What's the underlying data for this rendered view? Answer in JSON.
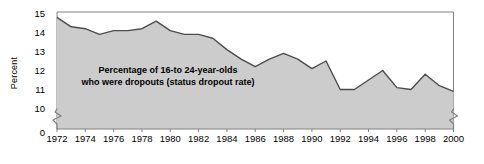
{
  "figure": {
    "ylabel": "Percent",
    "annotation_line1": "Percentage of 16-to 24-year-olds",
    "annotation_line2": "who were dropouts (status dropout rate)",
    "axis_break_label": "0",
    "fill_color": "#cccccc",
    "line_color": "#4d4d4d",
    "frame_color": "#808080",
    "text_color": "#000000"
  },
  "chart_data": {
    "type": "area",
    "title": "",
    "subtitle": "",
    "xlabel": "",
    "ylabel": "Percent",
    "xlim": [
      1972,
      2000
    ],
    "ylim": [
      9.5,
      15
    ],
    "y_axis_break": true,
    "y_break_between": [
      0,
      9.5
    ],
    "grid": false,
    "legend": "none",
    "annotations": [
      "Percentage of 16-to 24-year-olds",
      "who were dropouts (status dropout rate)"
    ],
    "ytick_labels": [
      "0",
      "10",
      "11",
      "12",
      "13",
      "14",
      "15"
    ],
    "yticks": [
      0,
      10,
      11,
      12,
      13,
      14,
      15
    ],
    "xtick_labels": [
      "1972",
      "1974",
      "1976",
      "1978",
      "1980",
      "1982",
      "1984",
      "1986",
      "1988",
      "1990",
      "1992",
      "1994",
      "1996",
      "1998",
      "2000"
    ],
    "xticks": [
      1972,
      1974,
      1976,
      1978,
      1980,
      1982,
      1984,
      1986,
      1988,
      1990,
      1992,
      1994,
      1996,
      1998,
      2000
    ],
    "series": [
      {
        "name": "Status dropout rate",
        "x": [
          1972,
          1973,
          1974,
          1975,
          1976,
          1977,
          1978,
          1979,
          1980,
          1981,
          1982,
          1983,
          1984,
          1985,
          1986,
          1987,
          1988,
          1989,
          1990,
          1991,
          1992,
          1993,
          1994,
          1995,
          1996,
          1997,
          1998,
          1999,
          2000
        ],
        "values": [
          14.8,
          14.3,
          14.2,
          13.9,
          14.1,
          14.1,
          14.2,
          14.6,
          14.1,
          13.9,
          13.9,
          13.7,
          13.1,
          12.6,
          12.2,
          12.6,
          12.9,
          12.6,
          12.1,
          12.5,
          11.0,
          11.0,
          11.5,
          12.0,
          11.1,
          11.0,
          11.8,
          11.2,
          10.9
        ]
      }
    ]
  }
}
